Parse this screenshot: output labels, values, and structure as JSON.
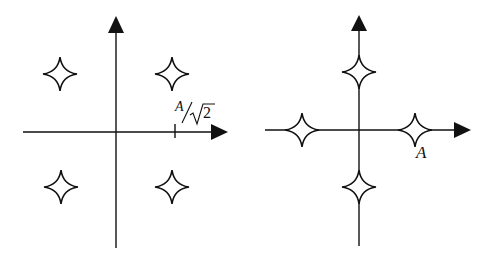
{
  "diagrams": [
    {
      "name": "constellation-qpsk-diagonal",
      "label": "A/√2",
      "label_parts": {
        "numerator": "A",
        "radicand": "2"
      },
      "points": [
        [
          1,
          1
        ],
        [
          -1,
          1
        ],
        [
          -1,
          -1
        ],
        [
          1,
          -1
        ]
      ]
    },
    {
      "name": "constellation-qpsk-axial",
      "label": "A",
      "points": [
        [
          1,
          0
        ],
        [
          0,
          1
        ],
        [
          -1,
          0
        ],
        [
          0,
          -1
        ]
      ]
    }
  ],
  "colors": {
    "stroke": "#111111",
    "background": "#ffffff"
  }
}
